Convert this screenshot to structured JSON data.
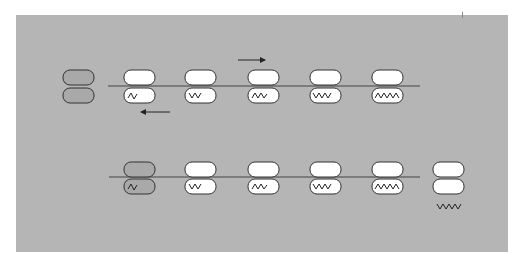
{
  "diagram": {
    "title": "",
    "colors": {
      "background_panel": "#b5b5b5",
      "subunit_fill": "#ffffff",
      "free_subunit_fill": "#a9a9a9",
      "outline": "#333333",
      "mrna_line": "#444444"
    },
    "rows": [
      {
        "name": "top-strand",
        "free_ribosome": {
          "label": "",
          "state": "free"
        },
        "ribosomes": [
          {
            "index": 1,
            "peptide_length": 2
          },
          {
            "index": 2,
            "peptide_length": 3
          },
          {
            "index": 3,
            "peptide_length": 4
          },
          {
            "index": 4,
            "peptide_length": 5
          },
          {
            "index": 5,
            "peptide_length": 6
          }
        ],
        "arrows": [
          {
            "direction": "right",
            "label": ""
          },
          {
            "direction": "left",
            "label": ""
          }
        ]
      },
      {
        "name": "bottom-strand",
        "ribosomes": [
          {
            "index": 1,
            "peptide_length": 2,
            "state": "joining"
          },
          {
            "index": 2,
            "peptide_length": 3
          },
          {
            "index": 3,
            "peptide_length": 4
          },
          {
            "index": 4,
            "peptide_length": 5
          },
          {
            "index": 5,
            "peptide_length": 6
          }
        ],
        "released": {
          "peptide_length": 6,
          "state": "released"
        }
      }
    ]
  }
}
